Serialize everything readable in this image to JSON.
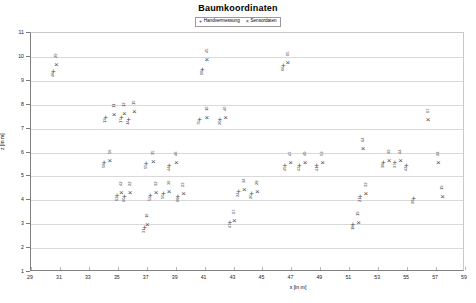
{
  "chart": {
    "title": "Baumkoordinaten",
    "xlabel": "x [in m]",
    "ylabel": "z [in m]",
    "legend": [
      {
        "label": "Handvermessung",
        "marker": "+"
      },
      {
        "label": "Sensordaten",
        "marker": "×"
      }
    ]
  },
  "chart_data": {
    "type": "scatter",
    "title": "Baumkoordinaten",
    "xlabel": "x [in m]",
    "ylabel": "z [in m]",
    "xlim": [
      29,
      59
    ],
    "ylim": [
      1,
      11
    ],
    "xticks": [
      29,
      31,
      33,
      35,
      37,
      39,
      41,
      43,
      45,
      47,
      49,
      51,
      53,
      55,
      57,
      59
    ],
    "yticks": [
      1,
      2,
      3,
      4,
      5,
      6,
      7,
      8,
      9,
      10,
      11
    ],
    "grid": true,
    "legend_position": "top-center",
    "series": [
      {
        "name": "Handvermessung",
        "marker": "+",
        "points": [
          {
            "id": "48",
            "x": 30.55,
            "y": 9.35
          },
          {
            "id": "13",
            "x": 34.15,
            "y": 7.45
          },
          {
            "id": "17",
            "x": 35.25,
            "y": 7.45
          },
          {
            "id": "14",
            "x": 35.75,
            "y": 7.35
          },
          {
            "id": "58",
            "x": 34.05,
            "y": 5.55
          },
          {
            "id": "62",
            "x": 34.95,
            "y": 4.2
          },
          {
            "id": "60",
            "x": 35.45,
            "y": 4.15
          },
          {
            "id": "31",
            "x": 36.85,
            "y": 2.85
          },
          {
            "id": "55",
            "x": 36.95,
            "y": 5.5
          },
          {
            "id": "52",
            "x": 37.25,
            "y": 4.2
          },
          {
            "id": "50",
            "x": 38.15,
            "y": 4.25
          },
          {
            "id": "44",
            "x": 38.55,
            "y": 5.45
          },
          {
            "id": "68",
            "x": 39.15,
            "y": 4.15
          },
          {
            "id": "08",
            "x": 40.85,
            "y": 9.45
          },
          {
            "id": "70",
            "x": 40.65,
            "y": 7.35
          },
          {
            "id": "20",
            "x": 42.05,
            "y": 7.35
          },
          {
            "id": "47",
            "x": 42.75,
            "y": 3.05
          },
          {
            "id": "24",
            "x": 43.35,
            "y": 4.35
          },
          {
            "id": "20b",
            "x": 44.25,
            "y": 4.25
          },
          {
            "id": "66",
            "x": 46.45,
            "y": 9.6
          },
          {
            "id": "45",
            "x": 46.55,
            "y": 5.45
          },
          {
            "id": "43",
            "x": 47.55,
            "y": 5.45
          },
          {
            "id": "41",
            "x": 48.75,
            "y": 5.45
          },
          {
            "id": "18",
            "x": 51.25,
            "y": 2.95
          },
          {
            "id": "21",
            "x": 51.75,
            "y": 4.15
          },
          {
            "id": "38",
            "x": 53.35,
            "y": 5.55
          },
          {
            "id": "37",
            "x": 54.15,
            "y": 5.55
          },
          {
            "id": "42",
            "x": 54.95,
            "y": 5.45
          },
          {
            "id": "26",
            "x": 55.45,
            "y": 4.05
          }
        ]
      },
      {
        "name": "Sensordaten",
        "marker": "×",
        "points": [
          {
            "id": "29",
            "x": 30.75,
            "y": 9.65
          },
          {
            "id": "11",
            "x": 34.75,
            "y": 7.55
          },
          {
            "id": "12",
            "x": 35.45,
            "y": 7.6
          },
          {
            "id": "15",
            "x": 36.15,
            "y": 7.7
          },
          {
            "id": "56",
            "x": 34.45,
            "y": 5.65
          },
          {
            "id": "42b",
            "x": 35.25,
            "y": 4.3
          },
          {
            "id": "22",
            "x": 35.85,
            "y": 4.3
          },
          {
            "id": "16",
            "x": 37.05,
            "y": 2.95
          },
          {
            "id": "35",
            "x": 37.45,
            "y": 5.6
          },
          {
            "id": "32",
            "x": 37.65,
            "y": 4.3
          },
          {
            "id": "36",
            "x": 38.55,
            "y": 4.35
          },
          {
            "id": "46",
            "x": 39.05,
            "y": 5.55
          },
          {
            "id": "23",
            "x": 39.55,
            "y": 4.25
          },
          {
            "id": "45b",
            "x": 41.15,
            "y": 9.85
          },
          {
            "id": "10",
            "x": 41.15,
            "y": 7.45
          },
          {
            "id": "40",
            "x": 42.45,
            "y": 7.45
          },
          {
            "id": "07",
            "x": 43.05,
            "y": 3.15
          },
          {
            "id": "34",
            "x": 43.75,
            "y": 4.45
          },
          {
            "id": "28",
            "x": 44.65,
            "y": 4.35
          },
          {
            "id": "05",
            "x": 46.75,
            "y": 9.75
          },
          {
            "id": "47b",
            "x": 46.95,
            "y": 5.55
          },
          {
            "id": "49",
            "x": 47.95,
            "y": 5.55
          },
          {
            "id": "53",
            "x": 49.15,
            "y": 5.55
          },
          {
            "id": "64",
            "x": 51.95,
            "y": 6.15
          },
          {
            "id": "19",
            "x": 51.65,
            "y": 3.05
          },
          {
            "id": "33",
            "x": 52.15,
            "y": 4.25
          },
          {
            "id": "39",
            "x": 53.75,
            "y": 5.65
          },
          {
            "id": "44b",
            "x": 54.55,
            "y": 5.65
          },
          {
            "id": "67",
            "x": 56.45,
            "y": 7.35
          },
          {
            "id": "24b",
            "x": 57.15,
            "y": 5.55
          },
          {
            "id": "19b",
            "x": 57.45,
            "y": 4.15
          }
        ]
      }
    ]
  }
}
